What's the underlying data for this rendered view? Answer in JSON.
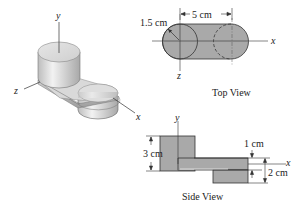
{
  "figure": {
    "isometric": {
      "axes": {
        "x": "x",
        "y": "y",
        "z": "z"
      }
    },
    "top_view": {
      "title": "Top View",
      "radius_label": "1.5 cm",
      "spacing_label": "5 cm",
      "axes": {
        "x": "x",
        "z": "z"
      }
    },
    "side_view": {
      "title": "Side View",
      "height_label": "3 cm",
      "thickness_label": "1 cm",
      "lower_height_label": "2 cm",
      "axes": {
        "x": "x",
        "y": "y"
      }
    },
    "colors": {
      "fill": "#a9a9a9",
      "fill_light": "#d4d4d4",
      "stroke": "#333333",
      "axis": "#333333"
    }
  }
}
